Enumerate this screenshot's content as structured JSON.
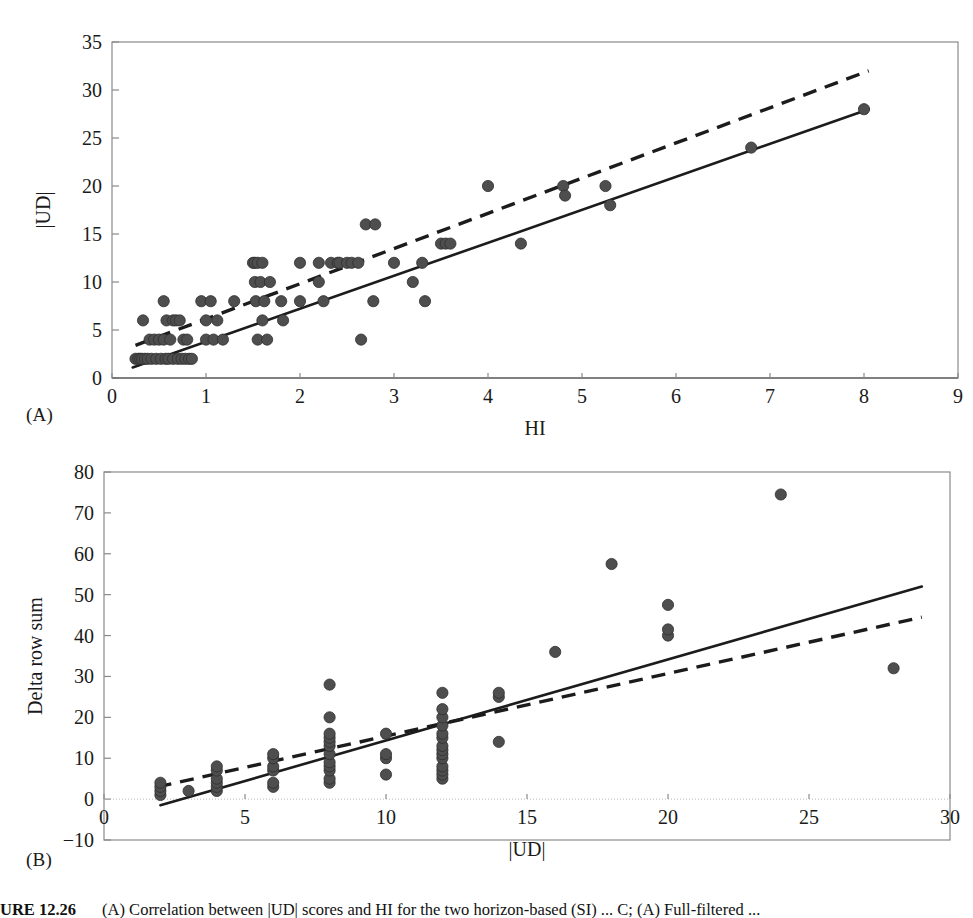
{
  "figure": {
    "caption_number": "URE 12.26",
    "caption_text": "(A) Correlation between |UD| scores and HI for the two horizon-based (SI) ... C; (A) Full-filtered ..."
  },
  "panels": [
    {
      "tag": "(A)",
      "name": "panel-a"
    },
    {
      "tag": "(B)",
      "name": "panel-b"
    }
  ],
  "chart_data": [
    {
      "type": "scatter",
      "panel": "A",
      "title": "",
      "xlabel": "HI",
      "ylabel": "|UD|",
      "xlim": [
        0,
        9
      ],
      "ylim": [
        0,
        35
      ],
      "xticks": [
        0,
        1,
        2,
        3,
        4,
        5,
        6,
        7,
        8,
        9
      ],
      "yticks": [
        0,
        5,
        10,
        15,
        20,
        25,
        30,
        35
      ],
      "grid": false,
      "legend": "none",
      "marker_color": "#4e4e4e",
      "points": [
        [
          0.25,
          2
        ],
        [
          0.28,
          2
        ],
        [
          0.3,
          2
        ],
        [
          0.32,
          2
        ],
        [
          0.33,
          6
        ],
        [
          0.35,
          2
        ],
        [
          0.38,
          2
        ],
        [
          0.4,
          4
        ],
        [
          0.42,
          2
        ],
        [
          0.45,
          4
        ],
        [
          0.47,
          2
        ],
        [
          0.5,
          4
        ],
        [
          0.52,
          2
        ],
        [
          0.55,
          8
        ],
        [
          0.55,
          4
        ],
        [
          0.57,
          2
        ],
        [
          0.58,
          6
        ],
        [
          0.6,
          2
        ],
        [
          0.62,
          4
        ],
        [
          0.65,
          6
        ],
        [
          0.65,
          2
        ],
        [
          0.68,
          6
        ],
        [
          0.7,
          2
        ],
        [
          0.72,
          6
        ],
        [
          0.74,
          2
        ],
        [
          0.76,
          4
        ],
        [
          0.78,
          2
        ],
        [
          0.8,
          4
        ],
        [
          0.82,
          2
        ],
        [
          0.85,
          2
        ],
        [
          0.95,
          8
        ],
        [
          1.0,
          6
        ],
        [
          1.0,
          4
        ],
        [
          1.05,
          8
        ],
        [
          1.08,
          4
        ],
        [
          1.12,
          6
        ],
        [
          1.18,
          4
        ],
        [
          1.3,
          8
        ],
        [
          1.5,
          12
        ],
        [
          1.52,
          12
        ],
        [
          1.52,
          10
        ],
        [
          1.53,
          8
        ],
        [
          1.55,
          4
        ],
        [
          1.55,
          12
        ],
        [
          1.58,
          10
        ],
        [
          1.6,
          12
        ],
        [
          1.6,
          6
        ],
        [
          1.62,
          8
        ],
        [
          1.65,
          4
        ],
        [
          1.68,
          10
        ],
        [
          1.8,
          8
        ],
        [
          1.82,
          6
        ],
        [
          2.0,
          12
        ],
        [
          2.0,
          8
        ],
        [
          2.2,
          12
        ],
        [
          2.2,
          10
        ],
        [
          2.25,
          8
        ],
        [
          2.33,
          12
        ],
        [
          2.4,
          12
        ],
        [
          2.42,
          12
        ],
        [
          2.5,
          12
        ],
        [
          2.55,
          12
        ],
        [
          2.62,
          12
        ],
        [
          2.65,
          4
        ],
        [
          2.7,
          16
        ],
        [
          2.78,
          8
        ],
        [
          2.8,
          16
        ],
        [
          3.0,
          12
        ],
        [
          3.2,
          10
        ],
        [
          3.3,
          12
        ],
        [
          3.33,
          8
        ],
        [
          3.5,
          14
        ],
        [
          3.55,
          14
        ],
        [
          3.6,
          14
        ],
        [
          4.0,
          20
        ],
        [
          4.35,
          14
        ],
        [
          4.8,
          20
        ],
        [
          4.82,
          19
        ],
        [
          5.25,
          20
        ],
        [
          5.3,
          18
        ],
        [
          6.8,
          24
        ],
        [
          8.0,
          28
        ]
      ],
      "fit_solid": {
        "x": [
          0.22,
          8.05
        ],
        "y": [
          1.1,
          28.0
        ],
        "style": "solid"
      },
      "fit_dashed": {
        "x": [
          0.25,
          8.05
        ],
        "y": [
          3.4,
          32.0
        ],
        "style": "dashed"
      }
    },
    {
      "type": "scatter",
      "panel": "B",
      "title": "",
      "xlabel": "|UD|",
      "ylabel": "Delta row sum",
      "xlim": [
        0,
        30
      ],
      "ylim": [
        -10,
        80
      ],
      "xticks": [
        0,
        5,
        10,
        15,
        20,
        25,
        30
      ],
      "yticks": [
        -10,
        0,
        10,
        20,
        30,
        40,
        50,
        60,
        70,
        80
      ],
      "grid": false,
      "legend": "none",
      "marker_color": "#4e4e4e",
      "points": [
        [
          2,
          1
        ],
        [
          2,
          2
        ],
        [
          2,
          3
        ],
        [
          2,
          4
        ],
        [
          3,
          2
        ],
        [
          4,
          2
        ],
        [
          4,
          3
        ],
        [
          4,
          4
        ],
        [
          4,
          5
        ],
        [
          4,
          7
        ],
        [
          4,
          8
        ],
        [
          6,
          3
        ],
        [
          6,
          4
        ],
        [
          6,
          7
        ],
        [
          6,
          8
        ],
        [
          6,
          10
        ],
        [
          6,
          11
        ],
        [
          8,
          4
        ],
        [
          8,
          5
        ],
        [
          8,
          7
        ],
        [
          8,
          8
        ],
        [
          8,
          9
        ],
        [
          8,
          11
        ],
        [
          8,
          13
        ],
        [
          8,
          14
        ],
        [
          8,
          15
        ],
        [
          8,
          16
        ],
        [
          8,
          20
        ],
        [
          8,
          28
        ],
        [
          10,
          6
        ],
        [
          10,
          10
        ],
        [
          10,
          11
        ],
        [
          10,
          16
        ],
        [
          12,
          5
        ],
        [
          12,
          6
        ],
        [
          12,
          7
        ],
        [
          12,
          8
        ],
        [
          12,
          10
        ],
        [
          12,
          11
        ],
        [
          12,
          12
        ],
        [
          12,
          13
        ],
        [
          12,
          15
        ],
        [
          12,
          16
        ],
        [
          12,
          18
        ],
        [
          12,
          20
        ],
        [
          12,
          22
        ],
        [
          12,
          26
        ],
        [
          14,
          14
        ],
        [
          14,
          25
        ],
        [
          14,
          26
        ],
        [
          16,
          36
        ],
        [
          18,
          57.5
        ],
        [
          20,
          40
        ],
        [
          20,
          41.5
        ],
        [
          20,
          47.5
        ],
        [
          24,
          74.5
        ],
        [
          28,
          32
        ]
      ],
      "fit_solid": {
        "x": [
          2.0,
          29.0
        ],
        "y": [
          -1.5,
          52.0
        ],
        "style": "solid"
      },
      "fit_dashed": {
        "x": [
          1.9,
          29.0
        ],
        "y": [
          3.0,
          44.5
        ],
        "style": "dashed"
      }
    }
  ]
}
